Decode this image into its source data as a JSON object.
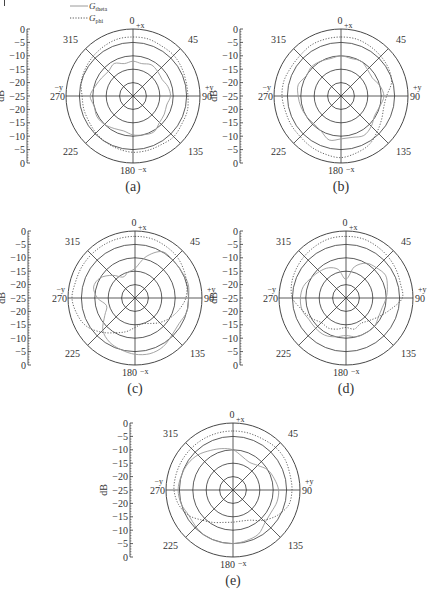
{
  "figure": {
    "legend": [
      {
        "label": "G",
        "subscript": "theta",
        "style": "solid"
      },
      {
        "label": "G",
        "subscript": "phi",
        "style": "dotted"
      }
    ],
    "colors": {
      "theta": "#9a9a9a",
      "phi": "#555555",
      "grid": "#333333"
    }
  },
  "chart_data": [
    {
      "type": "line",
      "subtype": "polar",
      "panel_label": "(a)",
      "ylabel": "dB",
      "r_ticks": [
        "0",
        "−5",
        "−10",
        "−15",
        "−20",
        "−25",
        "−20",
        "−15",
        "−10",
        "−5",
        "0"
      ],
      "r_range": [
        -25,
        0
      ],
      "angle_labels": {
        "0": "0",
        "45": "45",
        "90": "90",
        "135": "135",
        "180": "180",
        "225": "225",
        "270": "270",
        "315": "315"
      },
      "axis_labels": {
        "top": "+x",
        "bottom": "−x",
        "right": "+y",
        "left": "−y"
      },
      "angles_deg": [
        0,
        15,
        30,
        45,
        60,
        75,
        90,
        105,
        120,
        135,
        150,
        165,
        180,
        195,
        210,
        225,
        240,
        255,
        270,
        285,
        300,
        315,
        330,
        345
      ],
      "series": [
        {
          "name": "G_theta",
          "values": [
            -12,
            -12.5,
            -11.5,
            -12,
            -12.5,
            -11.5,
            -11,
            -12,
            -11.5,
            -11,
            -9.5,
            -10,
            -10.5,
            -11.5,
            -11,
            -10,
            -9.5,
            -10,
            -9,
            -10.5,
            -11.5,
            -12,
            -11,
            -12.5
          ]
        },
        {
          "name": "G_phi",
          "values": [
            -3,
            -3,
            -3.5,
            -3.5,
            -4,
            -4.5,
            -4.5,
            -4,
            -4,
            -3.5,
            -4,
            -4,
            -4,
            -4.5,
            -5,
            -5.5,
            -6,
            -6,
            -6,
            -5,
            -4.5,
            -4,
            -3.5,
            -3
          ]
        }
      ]
    },
    {
      "type": "line",
      "subtype": "polar",
      "panel_label": "(b)",
      "ylabel": "dB",
      "r_ticks": [
        "0",
        "−5",
        "−10",
        "−15",
        "−20",
        "−25",
        "−20",
        "−15",
        "−10",
        "−5",
        "0"
      ],
      "r_range": [
        -25,
        0
      ],
      "angle_labels": {
        "0": "0",
        "45": "45",
        "90": "90",
        "135": "135",
        "180": "180",
        "225": "225",
        "270": "270",
        "315": "315"
      },
      "axis_labels": {
        "top": "+x",
        "bottom": "−x",
        "right": "+y",
        "left": "−y"
      },
      "angles_deg": [
        0,
        15,
        30,
        45,
        60,
        75,
        90,
        105,
        120,
        135,
        150,
        165,
        180,
        195,
        210,
        225,
        240,
        255,
        270,
        285,
        300,
        315,
        330,
        345
      ],
      "series": [
        {
          "name": "G_theta",
          "values": [
            -10,
            -10.5,
            -10,
            -11,
            -11.5,
            -10,
            -9,
            -10,
            -10.5,
            -9,
            -8,
            -9,
            -9,
            -8,
            -10,
            -10.5,
            -10,
            -9.5,
            -9,
            -8.5,
            -10,
            -9.5,
            -10,
            -10.5
          ]
        },
        {
          "name": "G_phi",
          "values": [
            -3,
            -3,
            -3.5,
            -4,
            -4.5,
            -5.5,
            -8,
            -8.5,
            -7.5,
            -6,
            -4,
            -3,
            -2,
            -2.5,
            -3,
            -3.5,
            -3.5,
            -3.5,
            -3,
            -3,
            -3.5,
            -3.5,
            -3,
            -3
          ]
        }
      ]
    },
    {
      "type": "line",
      "subtype": "polar",
      "panel_label": "(c)",
      "ylabel": "dB",
      "r_ticks": [
        "0",
        "−5",
        "−10",
        "−15",
        "−20",
        "−25",
        "−20",
        "−15",
        "−10",
        "−5",
        "0"
      ],
      "r_range": [
        -25,
        0
      ],
      "angle_labels": {
        "0": "0",
        "45": "45",
        "90": "90",
        "135": "135",
        "180": "180",
        "225": "225",
        "270": "270",
        "315": "315"
      },
      "axis_labels": {
        "top": "+x",
        "bottom": "−x",
        "right": "+y",
        "left": "−y"
      },
      "angles_deg": [
        0,
        15,
        30,
        45,
        60,
        75,
        90,
        105,
        120,
        135,
        150,
        165,
        180,
        195,
        210,
        225,
        240,
        255,
        270,
        285,
        300,
        315,
        330,
        345
      ],
      "series": [
        {
          "name": "G_theta",
          "values": [
            -14,
            -9,
            -5,
            -5,
            -5,
            -4.5,
            -5,
            -5,
            -6,
            -5.5,
            -4,
            -3.5,
            -4,
            -5,
            -6,
            -8,
            -12,
            -14,
            -11,
            -9,
            -10,
            -13,
            -16,
            -15
          ]
        },
        {
          "name": "G_phi",
          "values": [
            -2,
            -2,
            -2.5,
            -3,
            -4,
            -5,
            -6,
            -8,
            -10,
            -12,
            -14,
            -15,
            -14,
            -12,
            -10,
            -7,
            -4,
            -2.5,
            -1.5,
            -2,
            -2,
            -2,
            -2,
            -2
          ]
        }
      ]
    },
    {
      "type": "line",
      "subtype": "polar",
      "panel_label": "(d)",
      "ylabel": "dB",
      "r_ticks": [
        "0",
        "−5",
        "−10",
        "−15",
        "−20",
        "−25",
        "−20",
        "−15",
        "−10",
        "−5",
        "0"
      ],
      "r_range": [
        -25,
        0
      ],
      "angle_labels": {
        "0": "0",
        "45": "45",
        "90": "90",
        "135": "135",
        "180": "180",
        "225": "225",
        "270": "270",
        "315": "315"
      },
      "axis_labels": {
        "top": "+x",
        "bottom": "−x",
        "right": "+y",
        "left": "−y"
      },
      "angles_deg": [
        0,
        15,
        30,
        45,
        60,
        75,
        90,
        105,
        120,
        135,
        150,
        165,
        180,
        195,
        210,
        225,
        240,
        255,
        270,
        285,
        300,
        315,
        330,
        345
      ],
      "series": [
        {
          "name": "G_theta",
          "values": [
            -18,
            -13,
            -10,
            -9,
            -8,
            -9,
            -10,
            -11,
            -11,
            -10,
            -10,
            -10,
            -11,
            -10,
            -9,
            -9,
            -9,
            -8,
            -8,
            -8.5,
            -10,
            -11,
            -12,
            -14
          ]
        },
        {
          "name": "G_phi",
          "values": [
            -2,
            -2,
            -2.5,
            -3,
            -3.5,
            -4,
            -4,
            -8,
            -11,
            -13,
            -14,
            -13,
            -14,
            -13,
            -12,
            -12,
            -10,
            -8,
            -5,
            -4,
            -3.5,
            -3,
            -2.5,
            -2
          ]
        }
      ]
    },
    {
      "type": "line",
      "subtype": "polar",
      "panel_label": "(e)",
      "ylabel": "dB",
      "r_ticks": [
        "0",
        "−5",
        "−10",
        "−15",
        "−20",
        "−25",
        "−20",
        "−15",
        "−10",
        "−5",
        "0"
      ],
      "r_range": [
        -25,
        0
      ],
      "angle_labels": {
        "0": "0",
        "45": "45",
        "90": "90",
        "135": "135",
        "180": "180",
        "225": "225",
        "270": "270",
        "315": "315"
      },
      "axis_labels": {
        "top": "+x",
        "bottom": "−x",
        "right": "+y",
        "left": "−y"
      },
      "angles_deg": [
        0,
        15,
        30,
        45,
        60,
        75,
        90,
        105,
        120,
        135,
        150,
        165,
        180,
        195,
        210,
        225,
        240,
        255,
        270,
        285,
        300,
        315,
        330,
        345
      ],
      "series": [
        {
          "name": "G_theta",
          "values": [
            -10,
            -12,
            -13,
            -12,
            -10,
            -9,
            -8,
            -8,
            -8.5,
            -8,
            -6,
            -5.5,
            -5,
            -5,
            -5,
            -5.5,
            -6,
            -5,
            -4.5,
            -5,
            -5.5,
            -6.5,
            -8,
            -9
          ]
        },
        {
          "name": "G_phi",
          "values": [
            -3,
            -3,
            -3,
            -2.5,
            -2.5,
            -3,
            -3,
            -3.5,
            -6,
            -9,
            -12,
            -13,
            -13,
            -12.5,
            -11,
            -9,
            -6,
            -4,
            -3,
            -3,
            -3,
            -3,
            -3,
            -3
          ]
        }
      ]
    }
  ]
}
